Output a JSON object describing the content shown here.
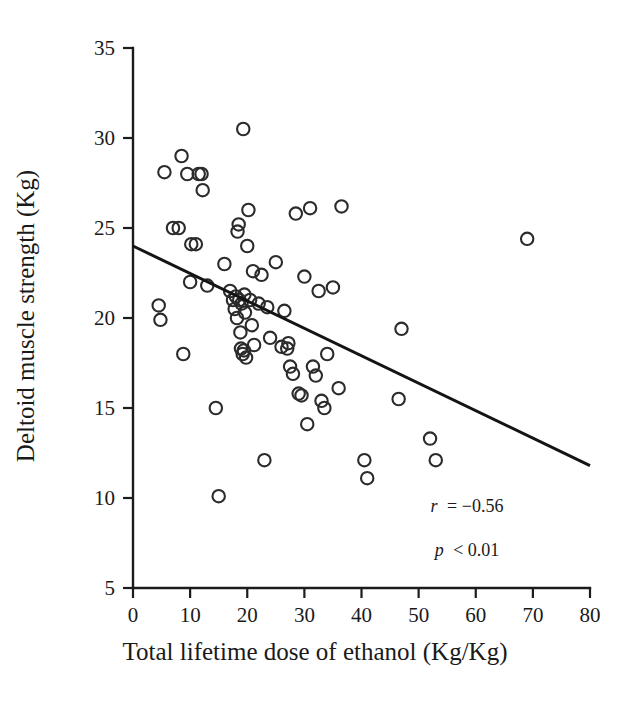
{
  "figure": {
    "background_color": "#ffffff",
    "ink_color": "#1a1a1a"
  },
  "axes": {
    "x_title": "Total lifetime dose of ethanol (Kg/Kg)",
    "y_title": "Deltoid muscle strength (Kg)",
    "x_ticks": [
      "0",
      "10",
      "20",
      "30",
      "40",
      "50",
      "60",
      "70",
      "80"
    ],
    "y_ticks": [
      "5",
      "10",
      "15",
      "20",
      "25",
      "30",
      "35"
    ]
  },
  "annotations": {
    "r_label": "r = −0.56",
    "p_label": "p < 0.01",
    "r_symbol": "r",
    "r_value": "= −0.56",
    "p_symbol": "p",
    "p_value": "< 0.01"
  },
  "chart_data": {
    "type": "scatter",
    "title": "",
    "xlabel": "Total lifetime dose of ethanol (Kg/Kg)",
    "ylabel": "Deltoid muscle strength (Kg)",
    "xlim": [
      0,
      80
    ],
    "ylim": [
      5,
      35
    ],
    "xticks": [
      0,
      10,
      20,
      30,
      40,
      50,
      60,
      70,
      80
    ],
    "yticks": [
      5,
      10,
      15,
      20,
      25,
      30,
      35
    ],
    "grid": false,
    "legend": "none",
    "marker": "open-circle",
    "marker_color": "#2b2b2b",
    "correlation_r": -0.56,
    "p_value_text": "< 0.01",
    "trendline": {
      "type": "linear",
      "x_start": 0,
      "y_start": 24.0,
      "x_end": 80,
      "y_end": 11.8,
      "slope": -0.1525,
      "intercept": 24.0
    },
    "points": [
      [
        4.5,
        20.7
      ],
      [
        4.8,
        19.9
      ],
      [
        5.5,
        28.1
      ],
      [
        7.0,
        25.0
      ],
      [
        8.0,
        25.0
      ],
      [
        8.5,
        29.0
      ],
      [
        8.8,
        18.0
      ],
      [
        9.5,
        28.0
      ],
      [
        10.0,
        22.0
      ],
      [
        10.2,
        24.1
      ],
      [
        11.0,
        24.1
      ],
      [
        11.5,
        28.0
      ],
      [
        12.0,
        28.0
      ],
      [
        12.2,
        27.1
      ],
      [
        13.0,
        21.8
      ],
      [
        14.5,
        15.0
      ],
      [
        15.0,
        10.1
      ],
      [
        16.0,
        23.0
      ],
      [
        17.0,
        21.5
      ],
      [
        17.5,
        21.0
      ],
      [
        17.8,
        20.5
      ],
      [
        18.0,
        21.2
      ],
      [
        18.2,
        20.0
      ],
      [
        18.3,
        24.8
      ],
      [
        18.5,
        25.2
      ],
      [
        18.6,
        21.0
      ],
      [
        18.8,
        19.2
      ],
      [
        18.9,
        18.3
      ],
      [
        19.0,
        20.8
      ],
      [
        19.2,
        18.0
      ],
      [
        19.3,
        30.5
      ],
      [
        19.4,
        18.2
      ],
      [
        19.5,
        21.3
      ],
      [
        19.6,
        20.3
      ],
      [
        19.8,
        17.8
      ],
      [
        20.0,
        24.0
      ],
      [
        20.2,
        26.0
      ],
      [
        20.5,
        21.0
      ],
      [
        20.8,
        19.6
      ],
      [
        21.0,
        22.6
      ],
      [
        21.2,
        18.5
      ],
      [
        22.0,
        20.8
      ],
      [
        22.5,
        22.4
      ],
      [
        23.0,
        12.1
      ],
      [
        23.5,
        20.6
      ],
      [
        24.0,
        18.9
      ],
      [
        25.0,
        23.1
      ],
      [
        26.0,
        18.4
      ],
      [
        26.5,
        20.4
      ],
      [
        27.0,
        18.3
      ],
      [
        27.2,
        18.6
      ],
      [
        27.5,
        17.3
      ],
      [
        28.0,
        16.9
      ],
      [
        28.5,
        25.8
      ],
      [
        29.0,
        15.8
      ],
      [
        29.5,
        15.7
      ],
      [
        30.0,
        22.3
      ],
      [
        30.5,
        14.1
      ],
      [
        31.0,
        26.1
      ],
      [
        31.5,
        17.3
      ],
      [
        32.0,
        16.8
      ],
      [
        32.5,
        21.5
      ],
      [
        33.0,
        15.4
      ],
      [
        33.5,
        15.0
      ],
      [
        34.0,
        18.0
      ],
      [
        35.0,
        21.7
      ],
      [
        36.0,
        16.1
      ],
      [
        36.5,
        26.2
      ],
      [
        40.5,
        12.1
      ],
      [
        41.0,
        11.1
      ],
      [
        46.5,
        15.5
      ],
      [
        47.0,
        19.4
      ],
      [
        52.0,
        13.3
      ],
      [
        53.0,
        12.1
      ],
      [
        69.0,
        24.4
      ]
    ]
  }
}
